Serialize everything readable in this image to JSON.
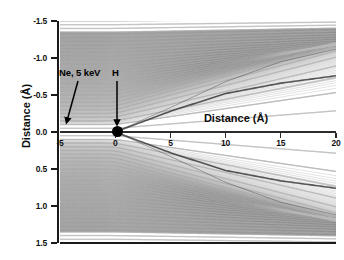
{
  "figure": {
    "type": "ion-trajectory-scattering-plot",
    "background_color": "#ffffff",
    "line_color": "#555555",
    "axis_color": "#1a1a1a"
  },
  "axes": {
    "y_title": "Distance (Å)",
    "inner_x_title": "Distance (Å)",
    "x_ticks": [
      "-5",
      "0",
      "5",
      "10",
      "15",
      "20"
    ],
    "y_ticks": [
      "1.5",
      "1.0",
      "0.5",
      "0.0",
      "-0.5",
      "-1.0",
      "-1.5"
    ]
  },
  "annotations": {
    "projectile_label": "Ne, 5 keV",
    "target_label": "H"
  },
  "particles": {
    "projectile_name": "Ne",
    "target_name": "H"
  },
  "chart_data": {
    "type": "line",
    "title": "",
    "subtitle": "",
    "xlabel": "Distance (Å)",
    "ylabel": "Distance (Å)",
    "xlim": [
      -5,
      20
    ],
    "ylim": [
      -1.5,
      1.5
    ],
    "xticks": [
      -5,
      0,
      5,
      10,
      15,
      20
    ],
    "yticks": [
      -1.5,
      -1.0,
      -0.5,
      0.0,
      0.5,
      1.0,
      1.5
    ],
    "grid": false,
    "legend": "none",
    "projectile": {
      "name": "Ne",
      "energy_keV": 5,
      "start_x": -5,
      "start_y": 0
    },
    "target": {
      "name": "H",
      "x": 0,
      "y": 0
    },
    "n_trajectories": 61,
    "impact_parameters": [
      -1.5,
      -1.45,
      -1.4,
      -1.35,
      -1.3,
      -1.25,
      -1.2,
      -1.15,
      -1.1,
      -1.05,
      -1.0,
      -0.95,
      -0.9,
      -0.85,
      -0.8,
      -0.75,
      -0.7,
      -0.65,
      -0.6,
      -0.55,
      -0.5,
      -0.45,
      -0.4,
      -0.35,
      -0.3,
      -0.25,
      -0.2,
      -0.15,
      -0.1,
      -0.05,
      0.0,
      0.05,
      0.1,
      0.15,
      0.2,
      0.25,
      0.3,
      0.35,
      0.4,
      0.45,
      0.5,
      0.55,
      0.6,
      0.65,
      0.7,
      0.75,
      0.8,
      0.85,
      0.9,
      0.95,
      1.0,
      1.05,
      1.1,
      1.15,
      1.2,
      1.25,
      1.3,
      1.35,
      1.4,
      1.45,
      1.5
    ],
    "caustic_envelopes": [
      {
        "name": "upper-rainbow-caustic",
        "points": [
          [
            0,
            0.0
          ],
          [
            5,
            0.28
          ],
          [
            10,
            0.52
          ],
          [
            15,
            0.66
          ],
          [
            20,
            0.76
          ]
        ]
      },
      {
        "name": "lower-rainbow-caustic",
        "points": [
          [
            0,
            0.0
          ],
          [
            5,
            -0.28
          ],
          [
            10,
            -0.52
          ],
          [
            15,
            -0.66
          ],
          [
            20,
            -0.76
          ]
        ]
      },
      {
        "name": "upper-outer-edge",
        "points": [
          [
            0,
            0.0
          ],
          [
            5,
            0.33
          ],
          [
            10,
            0.68
          ],
          [
            15,
            0.95
          ],
          [
            20,
            1.12
          ]
        ]
      },
      {
        "name": "lower-outer-edge",
        "points": [
          [
            0,
            0.0
          ],
          [
            5,
            -0.33
          ],
          [
            10,
            -0.68
          ],
          [
            15,
            -0.95
          ],
          [
            20,
            -1.12
          ]
        ]
      }
    ]
  }
}
